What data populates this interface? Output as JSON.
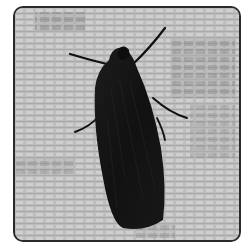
{
  "image": {
    "subject": "moth",
    "background": "lace-fabric",
    "palette": {
      "background": "#ffffff",
      "frame_border": "#2a2a2a",
      "fabric_base": "#b9b9b9",
      "fabric_light": "#d4d4d4",
      "fabric_dark": "#8a8a8a",
      "moth_body": "#141414",
      "moth_highlight": "#2e2e2e"
    }
  }
}
